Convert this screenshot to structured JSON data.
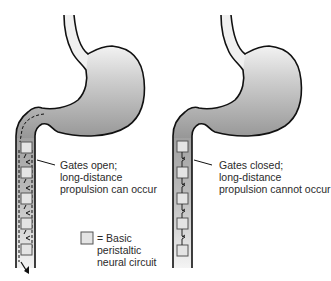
{
  "diagrams": [
    {
      "id": "left",
      "state": "open",
      "label_lines": [
        "Gates open;",
        "long-distance",
        "propulsion can occur"
      ]
    },
    {
      "id": "right",
      "state": "closed",
      "label_lines": [
        "Gates closed;",
        "long-distance",
        "propulsion cannot occur"
      ]
    }
  ],
  "legend": {
    "symbol": "gray-square",
    "label_lines": [
      "= Basic",
      "peristaltic",
      "neural circuit"
    ]
  },
  "colors": {
    "outline": "#111111",
    "fill_dark": "#9a9a9a",
    "fill_light": "#e6e6e6",
    "box_fill": "#e4e4e4",
    "box_stroke": "#555555"
  }
}
